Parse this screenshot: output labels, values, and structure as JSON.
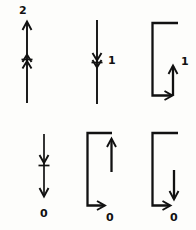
{
  "figure": {
    "title": "",
    "background_color": "#fdfdfb",
    "ink_color": "#111111",
    "width": 196,
    "height": 230,
    "panel_count": 6,
    "rows": 2,
    "columns": 3
  },
  "panels": [
    {
      "id": "panel-top-left",
      "position": "row1-col1",
      "label": "2",
      "label_position": "top",
      "shape": "vertical-line",
      "arrow_top": "up",
      "midpoint_marker": "double-barb-up-with-tick",
      "arrow_bottom": "none",
      "description": "Vertical line with upward arrowhead at top and a double barbed tick at the midpoint, labelled 2 above the arrow."
    },
    {
      "id": "panel-top-middle",
      "position": "row1-col2",
      "label": "1",
      "label_position": "right-of-midpoint",
      "shape": "vertical-line",
      "arrow_top": "none",
      "midpoint_marker": "double-barb-down-with-tick",
      "arrow_bottom": "none",
      "description": "Plain vertical line with a double barbed tick at the midpoint, labelled 1 to the right."
    },
    {
      "id": "panel-top-right",
      "position": "row1-col3",
      "label": "1",
      "label_position": "top-right-of-inner-arrow",
      "shape": "open-rectangle-left",
      "arrow_bottom": "right",
      "arrow_inner": "up",
      "description": "Open rectangular path: top edge running right, left edge down, bottom edge running right with a rightward arrowhead, then an inner vertical stroke with an upward arrowhead, labelled 1."
    },
    {
      "id": "panel-bottom-left",
      "position": "row2-col1",
      "label": "0",
      "label_position": "bottom",
      "shape": "vertical-line",
      "arrow_top": "none",
      "midpoint_marker": "barb-down-with-tick",
      "arrow_bottom": "down",
      "description": "Vertical line with a downward arrowhead and tick at the midpoint and a downward arrowhead at the bottom, labelled 0 below."
    },
    {
      "id": "panel-bottom-middle",
      "position": "row2-col2",
      "label": "0",
      "label_position": "bottom-right",
      "shape": "open-rectangle-left",
      "arrow_bottom": "right",
      "arrow_inner": "up",
      "description": "Open rectangular path with bottom edge ending in a rightward arrowhead and a tall inner vertical stroke with an upward arrowhead reaching toward the top edge, labelled 0."
    },
    {
      "id": "panel-bottom-right",
      "position": "row2-col3",
      "label": "0",
      "label_position": "bottom-right",
      "shape": "open-rectangle-left",
      "arrow_bottom": "right",
      "arrow_inner": "down",
      "description": "Open rectangular path with bottom edge ending in a rightward arrowhead and a short inner vertical stroke with a downward arrowhead, labelled 0."
    }
  ],
  "labels": {
    "two": "2",
    "one_a": "1",
    "one_b": "1",
    "zero_a": "0",
    "zero_b": "0",
    "zero_c": "0"
  }
}
